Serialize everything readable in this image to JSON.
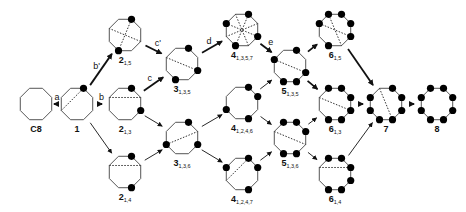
{
  "diagram": {
    "colors": {
      "stroke": "#555555",
      "dot": "#000000",
      "arrow": "#111111",
      "chord": "#333333"
    },
    "nodes": [
      {
        "id": "C8",
        "label": "C8",
        "sub": "",
        "x": 36,
        "y": 104,
        "dots": [],
        "chords": []
      },
      {
        "id": "1",
        "label": "1",
        "sub": "",
        "x": 77,
        "y": 104,
        "dots": [
          0
        ],
        "chords": [
          [
            0,
            5
          ]
        ]
      },
      {
        "id": "2_15",
        "label": "2",
        "sub": "1,5",
        "x": 125,
        "y": 35,
        "dots": [
          0,
          4
        ],
        "chords": [
          [
            0,
            4
          ],
          [
            2,
            6
          ]
        ]
      },
      {
        "id": "2_13",
        "label": "2",
        "sub": "1,3",
        "x": 125,
        "y": 104,
        "dots": [
          0,
          2
        ],
        "chords": [
          [
            6,
            1
          ]
        ]
      },
      {
        "id": "2_14",
        "label": "2",
        "sub": "1,4",
        "x": 125,
        "y": 172,
        "dots": [
          0,
          3
        ],
        "chords": [
          [
            6,
            1
          ]
        ]
      },
      {
        "id": "3_135",
        "label": "3",
        "sub": "1,3,5",
        "x": 182,
        "y": 64,
        "dots": [
          0,
          2,
          4
        ],
        "chords": [
          [
            6,
            2
          ]
        ]
      },
      {
        "id": "3_136",
        "label": "3",
        "sub": "1,3,6",
        "x": 182,
        "y": 138,
        "dots": [
          0,
          2,
          5
        ],
        "chords": [
          [
            5,
            1
          ]
        ]
      },
      {
        "id": "4_1357",
        "label": "4",
        "sub": "1,3,5,7",
        "x": 242,
        "y": 30,
        "dots": [
          0,
          2,
          4,
          6
        ],
        "chords": [
          [
            0,
            4
          ],
          [
            2,
            6
          ],
          [
            1,
            5
          ],
          [
            3,
            7
          ]
        ]
      },
      {
        "id": "4_1246",
        "label": "4",
        "sub": "1,2,4,6",
        "x": 242,
        "y": 103,
        "dots": [
          0,
          1,
          3,
          5
        ],
        "chords": []
      },
      {
        "id": "4_1247",
        "label": "4",
        "sub": "1,2,4,7",
        "x": 242,
        "y": 174,
        "dots": [
          0,
          1,
          3,
          6
        ],
        "chords": [
          [
            0,
            5
          ]
        ]
      },
      {
        "id": "5_135",
        "label": "5",
        "sub": "1,3,5",
        "x": 290,
        "y": 66,
        "dots": [
          0,
          2,
          3,
          4,
          6
        ],
        "chords": [
          [
            6,
            2
          ]
        ]
      },
      {
        "id": "5_136",
        "label": "5",
        "sub": "1,3,6",
        "x": 290,
        "y": 138,
        "dots": [
          0,
          1,
          3,
          4,
          7
        ],
        "chords": [
          [
            6,
            2
          ]
        ]
      },
      {
        "id": "6_15",
        "label": "6",
        "sub": "1,5",
        "x": 335,
        "y": 30,
        "dots": [
          0,
          1,
          2,
          4,
          6,
          7
        ],
        "chords": [
          [
            6,
            2
          ],
          [
            7,
            3
          ]
        ]
      },
      {
        "id": "6_13",
        "label": "6",
        "sub": "1,3",
        "x": 335,
        "y": 104,
        "dots": [
          0,
          1,
          2,
          3,
          4,
          7
        ],
        "chords": [
          [
            6,
            2
          ]
        ]
      },
      {
        "id": "6_14",
        "label": "6",
        "sub": "1,4",
        "x": 335,
        "y": 174,
        "dots": [
          0,
          1,
          2,
          3,
          4,
          7
        ],
        "chords": [
          [
            6,
            1
          ]
        ]
      },
      {
        "id": "7",
        "label": "7",
        "sub": "",
        "x": 386,
        "y": 104,
        "dots": [
          0,
          1,
          2,
          3,
          4,
          5,
          6
        ],
        "chords": [
          [
            7,
            3
          ]
        ]
      },
      {
        "id": "8",
        "label": "8",
        "sub": "",
        "x": 437,
        "y": 104,
        "dots": [
          0,
          1,
          2,
          3,
          4,
          5,
          6,
          7
        ],
        "chords": []
      }
    ],
    "edges": [
      {
        "from": "C8",
        "to": "1",
        "label": "a",
        "bold": true
      },
      {
        "from": "1",
        "to": "2_15",
        "label": "b'",
        "bold": true
      },
      {
        "from": "1",
        "to": "2_13",
        "label": "b",
        "bold": true
      },
      {
        "from": "1",
        "to": "2_14",
        "label": "",
        "bold": false
      },
      {
        "from": "2_15",
        "to": "3_135",
        "label": "c'",
        "bold": true
      },
      {
        "from": "2_13",
        "to": "3_135",
        "label": "c",
        "bold": true
      },
      {
        "from": "2_13",
        "to": "3_136",
        "label": "",
        "bold": false
      },
      {
        "from": "2_14",
        "to": "3_136",
        "label": "",
        "bold": false
      },
      {
        "from": "3_135",
        "to": "4_1357",
        "label": "d",
        "bold": true
      },
      {
        "from": "3_136",
        "to": "4_1246",
        "label": "",
        "bold": false
      },
      {
        "from": "3_136",
        "to": "4_1247",
        "label": "",
        "bold": false
      },
      {
        "from": "4_1357",
        "to": "5_135",
        "label": "e",
        "bold": true
      },
      {
        "from": "4_1246",
        "to": "5_135",
        "label": "",
        "bold": false
      },
      {
        "from": "4_1246",
        "to": "5_136",
        "label": "",
        "bold": false
      },
      {
        "from": "4_1247",
        "to": "5_136",
        "label": "",
        "bold": false
      },
      {
        "from": "5_135",
        "to": "6_15",
        "label": "",
        "bold": true
      },
      {
        "from": "5_135",
        "to": "6_13",
        "label": "",
        "bold": true
      },
      {
        "from": "5_136",
        "to": "6_13",
        "label": "",
        "bold": false
      },
      {
        "from": "5_136",
        "to": "6_14",
        "label": "",
        "bold": false
      },
      {
        "from": "6_15",
        "to": "7",
        "label": "",
        "bold": true
      },
      {
        "from": "6_13",
        "to": "7",
        "label": "",
        "bold": true
      },
      {
        "from": "6_14",
        "to": "7",
        "label": "",
        "bold": false
      },
      {
        "from": "7",
        "to": "8",
        "label": "",
        "bold": true
      }
    ]
  }
}
